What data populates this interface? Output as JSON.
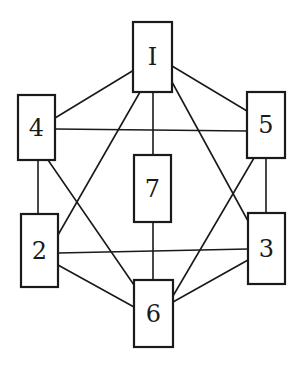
{
  "diagram": {
    "type": "graph",
    "nodes": [
      {
        "id": "1",
        "label": "I",
        "x": 133,
        "y": 22,
        "w": 39,
        "h": 70
      },
      {
        "id": "4",
        "label": "4",
        "x": 18,
        "y": 95,
        "w": 37,
        "h": 65
      },
      {
        "id": "5",
        "label": "5",
        "x": 247,
        "y": 92,
        "w": 38,
        "h": 66
      },
      {
        "id": "7",
        "label": "7",
        "x": 134,
        "y": 155,
        "w": 37,
        "h": 67
      },
      {
        "id": "2",
        "label": "2",
        "x": 21,
        "y": 214,
        "w": 37,
        "h": 73
      },
      {
        "id": "3",
        "label": "3",
        "x": 248,
        "y": 213,
        "w": 37,
        "h": 71
      },
      {
        "id": "6",
        "label": "6",
        "x": 134,
        "y": 280,
        "w": 39,
        "h": 67
      }
    ],
    "edges": [
      {
        "from": "1",
        "to": "4",
        "x1": 134,
        "y1": 70,
        "x2": 55,
        "y2": 118
      },
      {
        "from": "1",
        "to": "5",
        "x1": 172,
        "y1": 66,
        "x2": 247,
        "y2": 111
      },
      {
        "from": "1",
        "to": "7",
        "x1": 153,
        "y1": 92,
        "x2": 153,
        "y2": 155
      },
      {
        "from": "1",
        "to": "2",
        "x1": 140,
        "y1": 92,
        "x2": 58,
        "y2": 235
      },
      {
        "from": "1",
        "to": "3",
        "x1": 172,
        "y1": 82,
        "x2": 248,
        "y2": 221
      },
      {
        "from": "4",
        "to": "5",
        "x1": 55,
        "y1": 129,
        "x2": 247,
        "y2": 131
      },
      {
        "from": "4",
        "to": "2",
        "x1": 38,
        "y1": 160,
        "x2": 38,
        "y2": 214
      },
      {
        "from": "4",
        "to": "6",
        "x1": 48,
        "y1": 160,
        "x2": 134,
        "y2": 285
      },
      {
        "from": "5",
        "to": "3",
        "x1": 266,
        "y1": 158,
        "x2": 266,
        "y2": 213
      },
      {
        "from": "5",
        "to": "6",
        "x1": 254,
        "y1": 158,
        "x2": 173,
        "y2": 296
      },
      {
        "from": "7",
        "to": "6",
        "x1": 153,
        "y1": 222,
        "x2": 153,
        "y2": 280
      },
      {
        "from": "2",
        "to": "3",
        "x1": 58,
        "y1": 253,
        "x2": 248,
        "y2": 249
      },
      {
        "from": "2",
        "to": "6",
        "x1": 58,
        "y1": 265,
        "x2": 134,
        "y2": 307
      },
      {
        "from": "3",
        "to": "6",
        "x1": 248,
        "y1": 260,
        "x2": 173,
        "y2": 302
      }
    ]
  }
}
